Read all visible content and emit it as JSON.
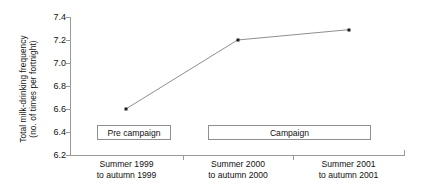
{
  "chart_data": {
    "type": "line",
    "title": "",
    "subtitle": "",
    "xlabel": "",
    "ylabel": "Total milk-drinking frequency (no. of times per fortnight)",
    "ylabel_lines": [
      "Total milk-drinking frequency",
      "(no. of times per fortnight)"
    ],
    "categories": [
      "Summer 1999 to autumn 1999",
      "Summer 2000 to autumn 2000",
      "Summer 2001 to autumn 2001"
    ],
    "category_lines": [
      [
        "Summer 1999",
        "to autumn 1999"
      ],
      [
        "Summer 2000",
        "to autumn 2000"
      ],
      [
        "Summer 2001",
        "to autumn 2001"
      ]
    ],
    "values": [
      6.6,
      7.2,
      7.29
    ],
    "ylim": [
      6.2,
      7.4
    ],
    "yticks": [
      "7.4",
      "7.2",
      "7.0",
      "6.8",
      "6.6",
      "6.4",
      "6.2"
    ],
    "ytick_values": [
      7.4,
      7.2,
      7.0,
      6.8,
      6.6,
      6.4,
      6.2
    ],
    "grid": false,
    "legend_position": "none",
    "marker": "square",
    "line_color": "#8f8f8f",
    "marker_color": "#1c1c1c",
    "axis_color": "#9a9a9a",
    "background_color": "#ffffff",
    "annotations": [
      {
        "label": "Pre campaign",
        "spans_categories": [
          0
        ],
        "at_value": 6.4
      },
      {
        "label": "Campaign",
        "spans_categories": [
          1,
          2
        ],
        "at_value": 6.4
      }
    ]
  }
}
